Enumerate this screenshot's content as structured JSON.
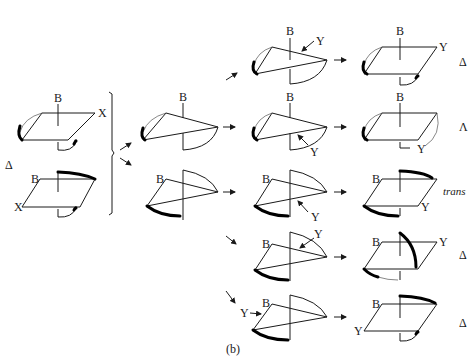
{
  "figure": {
    "caption": "(b)",
    "colors": {
      "stroke": "#1a1a1a",
      "background": "#ffffff"
    }
  },
  "start": {
    "top": {
      "label_b": "B",
      "label_x": "X"
    },
    "bottom": {
      "label_b": "B",
      "label_x": "X"
    },
    "side_label": "Δ"
  },
  "intermediates": [
    {
      "label_b": "B"
    },
    {
      "label_b": "B"
    }
  ],
  "rows": [
    {
      "mid_b": "B",
      "mid_y": "Y",
      "prod_b": "B",
      "prod_y": "Y",
      "stereo": "Δ"
    },
    {
      "mid_b": "B",
      "mid_y": "Y",
      "prod_b": "B",
      "prod_y": "Y",
      "stereo": "Λ"
    },
    {
      "mid_b": "B",
      "mid_y": "Y",
      "prod_b": "B",
      "prod_y": "Y",
      "stereo": "trans"
    },
    {
      "mid_b": "B",
      "mid_y": "Y",
      "prod_b": "B",
      "prod_y": "Y",
      "stereo": "Δ"
    },
    {
      "mid_b": "B",
      "mid_y": "Y",
      "prod_b": "B",
      "prod_y": "Y",
      "stereo": "Δ"
    }
  ]
}
